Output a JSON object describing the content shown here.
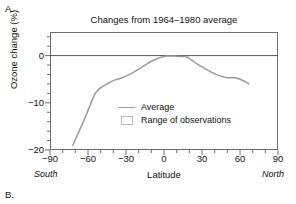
{
  "panels": {
    "a_label": "A.",
    "b_label": "B."
  },
  "chart_data": {
    "type": "line",
    "title": "Changes from 1964–1980 average",
    "xlabel": "Latitude",
    "ylabel": "Ozone change (%)",
    "xlim": [
      -90,
      90
    ],
    "ylim": [
      -20,
      5
    ],
    "grid": false,
    "zero_line": true,
    "xticks": [
      -90,
      -60,
      -30,
      0,
      30,
      60,
      90
    ],
    "xtick_labels": [
      "−90",
      "−60",
      "−30",
      "0",
      "30",
      "60",
      "90"
    ],
    "xminor_step": 10,
    "yticks": [
      0,
      -10,
      -20
    ],
    "ytick_labels": [
      "0",
      "−10",
      "−20"
    ],
    "yminor_step": 2,
    "axis_annotations": {
      "left_pole": "South",
      "right_pole": "North"
    },
    "legend": {
      "position": "inside-center",
      "entries": [
        {
          "label": "Average",
          "marker": "line",
          "color": "#9a9a9a"
        },
        {
          "label": "Range of observations",
          "marker": "box",
          "color": "#b9b9b9"
        }
      ]
    },
    "series": [
      {
        "name": "Average",
        "color": "#9a9a9a",
        "x": [
          -72,
          -68,
          -64,
          -61,
          -58,
          -56,
          -54,
          -51,
          -47,
          -43,
          -38,
          -33,
          -28,
          -22,
          -16,
          -10,
          -4,
          2,
          8,
          14,
          18,
          22,
          27,
          32,
          38,
          43,
          48,
          52,
          56,
          60,
          64,
          67
        ],
        "y": [
          -19.0,
          -16.6,
          -14.2,
          -12.3,
          -10.3,
          -9.0,
          -7.9,
          -7.0,
          -6.3,
          -5.7,
          -5.1,
          -4.7,
          -4.1,
          -3.2,
          -2.2,
          -1.2,
          -0.5,
          -0.1,
          -0.1,
          -0.2,
          -0.3,
          -1.0,
          -1.9,
          -2.7,
          -3.6,
          -4.2,
          -4.6,
          -4.7,
          -4.7,
          -5.0,
          -5.5,
          -6.0
        ]
      }
    ]
  }
}
